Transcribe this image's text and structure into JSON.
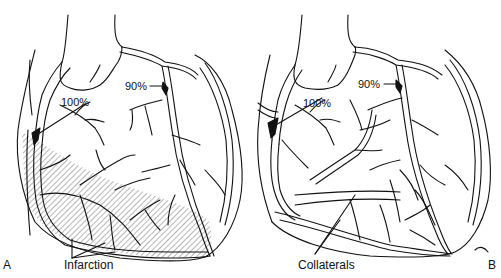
{
  "figure": {
    "panels": [
      {
        "id": "A",
        "panel_label": "A",
        "stenosis_labels": [
          "100%",
          "90%"
        ],
        "annotation": "Infarction"
      },
      {
        "id": "B",
        "panel_label": "B",
        "stenosis_labels": [
          "100%",
          "90%"
        ],
        "annotation": "Collaterals"
      }
    ],
    "colors": {
      "line": "#111111",
      "background": "#ffffff",
      "hatch": "#555555"
    }
  }
}
